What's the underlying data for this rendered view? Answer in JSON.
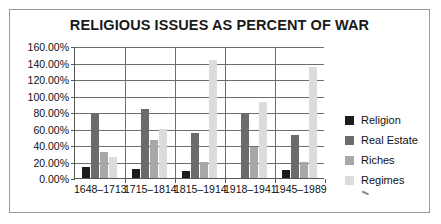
{
  "chart_data": {
    "type": "bar",
    "title": "RELIGIOUS ISSUES AS PERCENT OF WAR",
    "xlabel": "",
    "ylabel": "",
    "categories": [
      "1648–1713",
      "1715–1814",
      "1815–1914",
      "1918–1941",
      "1945–1989"
    ],
    "series": [
      {
        "name": "Religion",
        "color": "#1c1c1c",
        "values": [
          13,
          11,
          9,
          0,
          10
        ]
      },
      {
        "name": "Real Estate",
        "color": "#6b6b6b",
        "values": [
          78,
          84,
          55,
          77,
          52
        ]
      },
      {
        "name": "Riches",
        "color": "#a8a8a8",
        "values": [
          31,
          46,
          19,
          37,
          20
        ]
      },
      {
        "name": "Regimes",
        "color": "#dcdcdc",
        "values": [
          25,
          60,
          143,
          92,
          135
        ]
      }
    ],
    "ylim": [
      0,
      160
    ],
    "ytick_step": 20,
    "ytick_labels": [
      "0.00%",
      "20.00%",
      "40.00%",
      "60.00%",
      "80.00%",
      "100.00%",
      "120.00%",
      "140.00%",
      "160.00%"
    ],
    "grid": true,
    "legend_position": "right"
  },
  "legend": {
    "entries": [
      {
        "label": "Religion",
        "color": "#1c1c1c"
      },
      {
        "label": "Real Estate",
        "color": "#6b6b6b"
      },
      {
        "label": "Riches",
        "color": "#a8a8a8"
      },
      {
        "label": "Regimes",
        "color": "#dcdcdc"
      }
    ]
  },
  "colors": {
    "frame_border": "#9a9a9a",
    "gridline": "#6e6e6e",
    "axis": "#575757",
    "text": "#111111",
    "background": "#ffffff"
  }
}
